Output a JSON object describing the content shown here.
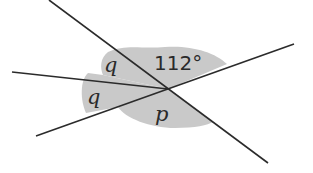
{
  "diagram": {
    "type": "intersecting-lines-angles",
    "labels": {
      "top_left": "q",
      "left": "q",
      "top_right": "112°",
      "bottom": "p"
    },
    "colors": {
      "shade": "#c9c9c9",
      "line": "#2b2b2b",
      "background": "#ffffff"
    }
  }
}
